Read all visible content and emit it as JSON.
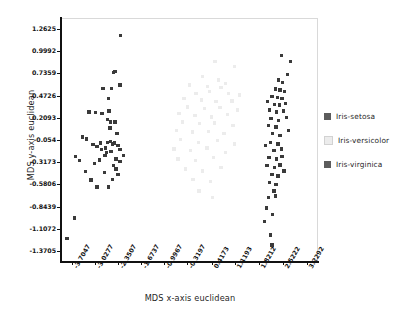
{
  "chart_data": {
    "type": "scatter",
    "title": "",
    "xlabel": "MDS x-axis euclidean",
    "ylabel": "MDS y-axis euclidean",
    "xlim": [
      -4.0432,
      3.5677
    ],
    "ylim": [
      -1.50215,
      1.39415
    ],
    "grid": false,
    "legend_position": "right",
    "xticks": [
      "-3.7047",
      "-3.0277",
      "-2.3507",
      "-1.6737",
      "-0.9967",
      "-0.3197",
      "0.4173",
      "1.1193",
      "1.8212",
      "2.5222",
      "3.2292"
    ],
    "xtick_values": [
      -3.7047,
      -3.0277,
      -2.3507,
      -1.6737,
      -0.9967,
      -0.3197,
      0.4173,
      1.1193,
      1.8212,
      2.5222,
      3.2292
    ],
    "yticks": [
      "1.2625",
      "0.9992",
      "0.7359",
      "0.4726",
      "0.2093",
      "-0.054",
      "-0.3173",
      "-0.5806",
      "-0.8439",
      "-1.1072",
      "-1.3705"
    ],
    "ytick_values": [
      1.2625,
      0.9992,
      0.7359,
      0.4726,
      0.2093,
      -0.054,
      -0.3173,
      -0.5806,
      -0.8439,
      -1.1072,
      -1.3705
    ],
    "series": [
      {
        "name": "Iris-setosa",
        "color": "#3a3a3a",
        "points": [
          [
            -2.29,
            1.19
          ],
          [
            -2.49,
            0.75
          ],
          [
            -2.44,
            0.76
          ],
          [
            -2.8,
            0.56
          ],
          [
            -2.54,
            0.56
          ],
          [
            -2.3,
            0.6
          ],
          [
            -2.63,
            0.44
          ],
          [
            -3.21,
            0.28
          ],
          [
            -3.02,
            0.27
          ],
          [
            -2.83,
            0.26
          ],
          [
            -2.62,
            0.29
          ],
          [
            -2.66,
            0.19
          ],
          [
            -2.58,
            0.16
          ],
          [
            -2.45,
            0.16
          ],
          [
            -2.59,
            0.09
          ],
          [
            -3.41,
            -0.02
          ],
          [
            -3.29,
            -0.04
          ],
          [
            -3.1,
            -0.11
          ],
          [
            -2.98,
            -0.13
          ],
          [
            -2.88,
            -0.09
          ],
          [
            -2.66,
            -0.08
          ],
          [
            -2.58,
            -0.07
          ],
          [
            -2.52,
            -0.1
          ],
          [
            -2.46,
            -0.09
          ],
          [
            -2.84,
            -0.17
          ],
          [
            -2.7,
            -0.2
          ],
          [
            -2.56,
            -0.19
          ],
          [
            -2.36,
            -0.12
          ],
          [
            -2.3,
            -0.17
          ],
          [
            -3.62,
            -0.25
          ],
          [
            -3.5,
            -0.3
          ],
          [
            -3.06,
            -0.33
          ],
          [
            -2.42,
            -0.28
          ],
          [
            -2.3,
            -0.31
          ],
          [
            -3.31,
            -0.43
          ],
          [
            -3.15,
            -0.53
          ],
          [
            -2.9,
            -0.29
          ],
          [
            -2.74,
            -0.24
          ],
          [
            -2.48,
            -0.36
          ],
          [
            -2.42,
            -0.4
          ],
          [
            -2.75,
            -0.44
          ],
          [
            -3.64,
            -0.98
          ],
          [
            -3.86,
            -1.22
          ],
          [
            -2.36,
            -0.46
          ],
          [
            -2.52,
            -0.52
          ],
          [
            -2.63,
            -0.61
          ],
          [
            -2.98,
            -0.61
          ],
          [
            -2.2,
            -0.24
          ],
          [
            -2.72,
            -0.15
          ],
          [
            -2.38,
            0.02
          ]
        ]
      },
      {
        "name": "Iris-versicolor",
        "color": "#ececec",
        "points": [
          [
            0.52,
            0.88
          ],
          [
            1.1,
            0.82
          ],
          [
            0.15,
            0.7
          ],
          [
            0.62,
            0.66
          ],
          [
            0.82,
            0.62
          ],
          [
            -0.24,
            0.6
          ],
          [
            0.3,
            0.58
          ],
          [
            0.7,
            0.57
          ],
          [
            -0.05,
            0.5
          ],
          [
            0.36,
            0.52
          ],
          [
            0.92,
            0.5
          ],
          [
            1.25,
            0.48
          ],
          [
            -0.4,
            0.44
          ],
          [
            0.12,
            0.42
          ],
          [
            0.55,
            0.4
          ],
          [
            1.02,
            0.41
          ],
          [
            -0.3,
            0.34
          ],
          [
            0.2,
            0.32
          ],
          [
            0.66,
            0.33
          ],
          [
            1.18,
            0.3
          ],
          [
            -0.55,
            0.26
          ],
          [
            -0.08,
            0.24
          ],
          [
            0.42,
            0.22
          ],
          [
            0.88,
            0.25
          ],
          [
            -0.45,
            0.16
          ],
          [
            0.05,
            0.14
          ],
          [
            0.5,
            0.15
          ],
          [
            1.05,
            0.12
          ],
          [
            -0.62,
            0.06
          ],
          [
            -0.15,
            0.04
          ],
          [
            0.32,
            0.05
          ],
          [
            0.78,
            0.02
          ],
          [
            -0.5,
            -0.05
          ],
          [
            0.02,
            -0.08
          ],
          [
            0.6,
            -0.06
          ],
          [
            1.1,
            -0.1
          ],
          [
            -0.7,
            -0.16
          ],
          [
            -0.2,
            -0.18
          ],
          [
            0.28,
            -0.15
          ],
          [
            0.82,
            -0.2
          ],
          [
            -0.58,
            -0.28
          ],
          [
            -0.06,
            -0.3
          ],
          [
            0.48,
            -0.26
          ],
          [
            -0.35,
            -0.4
          ],
          [
            0.15,
            -0.42
          ],
          [
            0.7,
            -0.38
          ],
          [
            -0.14,
            -0.52
          ],
          [
            0.38,
            -0.55
          ],
          [
            0.04,
            -0.66
          ],
          [
            0.45,
            -0.74
          ]
        ]
      },
      {
        "name": "Iris-virginica",
        "color": "#3a3a3a",
        "points": [
          [
            2.49,
            0.95
          ],
          [
            2.76,
            0.88
          ],
          [
            2.66,
            0.72
          ],
          [
            2.4,
            0.66
          ],
          [
            2.52,
            0.63
          ],
          [
            2.3,
            0.55
          ],
          [
            2.44,
            0.54
          ],
          [
            2.58,
            0.52
          ],
          [
            2.2,
            0.46
          ],
          [
            2.36,
            0.45
          ],
          [
            2.5,
            0.44
          ],
          [
            2.28,
            0.37
          ],
          [
            2.42,
            0.36
          ],
          [
            2.14,
            0.3
          ],
          [
            2.34,
            0.28
          ],
          [
            2.54,
            0.29
          ],
          [
            2.18,
            0.2
          ],
          [
            2.4,
            0.18
          ],
          [
            2.64,
            0.21
          ],
          [
            2.1,
            0.12
          ],
          [
            2.32,
            0.1
          ],
          [
            2.22,
            0.02
          ],
          [
            2.44,
            0.0
          ],
          [
            2.16,
            -0.08
          ],
          [
            2.38,
            -0.1
          ],
          [
            2.26,
            -0.18
          ],
          [
            2.48,
            -0.16
          ],
          [
            2.12,
            -0.26
          ],
          [
            2.34,
            -0.28
          ],
          [
            2.5,
            -0.25
          ],
          [
            2.06,
            -0.36
          ],
          [
            2.28,
            -0.38
          ],
          [
            2.44,
            -0.35
          ],
          [
            2.2,
            -0.46
          ],
          [
            2.38,
            -0.48
          ],
          [
            2.14,
            -0.56
          ],
          [
            2.32,
            -0.58
          ],
          [
            2.26,
            -0.66
          ],
          [
            2.1,
            -0.74
          ],
          [
            2.3,
            -0.72
          ],
          [
            2.04,
            -0.86
          ],
          [
            2.22,
            -0.94
          ],
          [
            1.98,
            -1.02
          ],
          [
            2.16,
            -1.18
          ],
          [
            2.2,
            -1.3
          ],
          [
            2.6,
            0.38
          ],
          [
            2.7,
            0.06
          ],
          [
            2.08,
            0.4
          ],
          [
            2.02,
            -0.12
          ],
          [
            2.56,
            -0.42
          ]
        ]
      }
    ]
  },
  "legend": {
    "items": [
      {
        "label": "Iris-setosa",
        "color": "#5c5c5c"
      },
      {
        "label": "Iris-versicolor",
        "color": "#ececec"
      },
      {
        "label": "Iris-virginica",
        "color": "#5c5c5c"
      }
    ]
  }
}
